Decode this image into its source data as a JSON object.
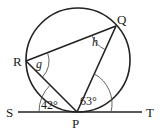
{
  "diagram": {
    "type": "circle-theorem",
    "points": {
      "S": {
        "label": "S"
      },
      "T": {
        "label": "T"
      },
      "P": {
        "label": "P"
      },
      "Q": {
        "label": "Q"
      },
      "R": {
        "label": "R"
      }
    },
    "angles": {
      "SPR": {
        "label": "42°"
      },
      "QPT": {
        "label": "63°"
      },
      "QRP": {
        "label": "g"
      },
      "RQP": {
        "label": "h"
      }
    }
  }
}
